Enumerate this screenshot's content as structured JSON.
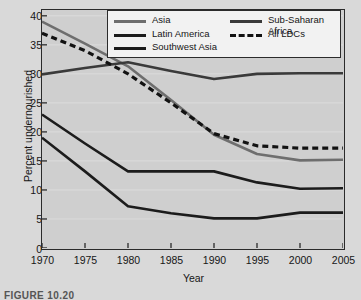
{
  "figure": {
    "caption": "FIGURE 10.20"
  },
  "chart_data": {
    "type": "line",
    "title": "",
    "xlabel": "Year",
    "ylabel": "Percent undernourished",
    "x": [
      1970,
      1975,
      1980,
      1985,
      1990,
      1995,
      2000,
      2005
    ],
    "xlim": [
      1970,
      2005
    ],
    "ylim": [
      0,
      41
    ],
    "xticks": [
      "1970",
      "1975",
      "1980",
      "1985",
      "1990",
      "1995",
      "2000",
      "2005"
    ],
    "yticks": [
      "0",
      "5",
      "10",
      "15",
      "20",
      "25",
      "30",
      "35",
      "40"
    ],
    "grid": true,
    "legend_position": "top-center",
    "series": [
      {
        "name": "Asia",
        "color": "#6e6e6e",
        "style": "solid",
        "values": [
          39.0,
          35.2,
          31.3,
          25.5,
          19.5,
          16.2,
          15.1,
          15.2
        ]
      },
      {
        "name": "Latin America",
        "color": "#1c1c1c",
        "style": "solid",
        "values": [
          23.0,
          18.0,
          13.2,
          13.2,
          13.2,
          11.3,
          10.2,
          10.3
        ]
      },
      {
        "name": "Southwest Asia",
        "color": "#1c1c1c",
        "style": "solid",
        "values": [
          19.0,
          13.2,
          7.2,
          6.0,
          5.1,
          5.1,
          6.1,
          6.1
        ]
      },
      {
        "name": "Sub-Saharan Africa",
        "color": "#3a3a3a",
        "style": "solid",
        "values": [
          29.9,
          31.0,
          32.0,
          30.5,
          29.1,
          30.0,
          30.1,
          30.1
        ]
      },
      {
        "name": "All LDCs",
        "color": "#121212",
        "style": "dashed",
        "values": [
          37.0,
          34.0,
          30.0,
          25.0,
          19.7,
          17.6,
          17.2,
          17.2
        ]
      }
    ]
  },
  "legend": {
    "columns": [
      [
        {
          "label": "Asia",
          "swatch": "line-gray",
          "color": "#6e6e6e",
          "style": "solid"
        },
        {
          "label": "Latin America",
          "swatch": "line-black",
          "color": "#1c1c1c",
          "style": "solid"
        },
        {
          "label": "Southwest Asia",
          "swatch": "line-black",
          "color": "#1c1c1c",
          "style": "solid"
        }
      ],
      [
        {
          "label": "Sub-Saharan\nAfrica",
          "swatch": "line-dark",
          "color": "#3a3a3a",
          "style": "solid"
        },
        {
          "label": "All LDCs",
          "swatch": "line-dashed",
          "color": "#121212",
          "style": "dashed"
        }
      ]
    ]
  }
}
